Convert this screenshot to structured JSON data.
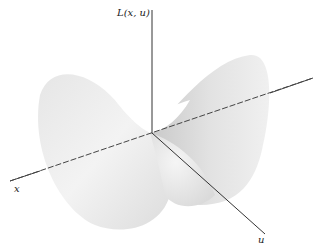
{
  "diagram": {
    "type": "3d-surface-plot",
    "axes": {
      "vertical": {
        "label": "L(x, u)"
      },
      "x": {
        "label": "x"
      },
      "u": {
        "label": "u"
      }
    },
    "colors": {
      "background": "#ffffff",
      "surface_light": "#f4f4f4",
      "surface_dark": "#c8c8c8",
      "axis": "#333333"
    }
  }
}
